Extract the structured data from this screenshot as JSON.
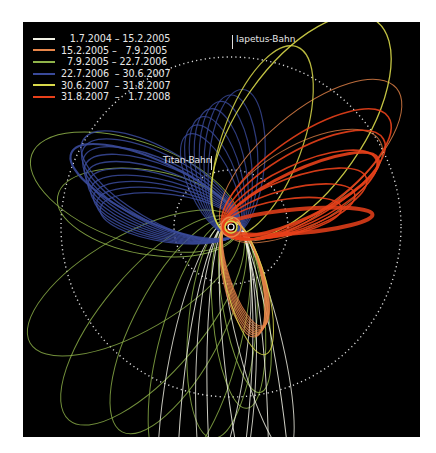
{
  "chart_data": {
    "type": "diagram",
    "title": "",
    "legend": [
      {
        "label": "   1.7.2004 – 15.2.2005",
        "color": "#f2f2e6"
      },
      {
        "label": "15.2.2005 –   7.9.2005",
        "color": "#e8864a"
      },
      {
        "label": "  7.9.2005 – 22.7.2006",
        "color": "#8fb34a"
      },
      {
        "label": "22.7.2006  – 30.6.2007",
        "color": "#3a4a9a"
      },
      {
        "label": "30.6.2007  – 31.8.2007",
        "color": "#d8d84a"
      },
      {
        "label": "31.8.2007  –   1.7.2008",
        "color": "#e8401a"
      }
    ],
    "annotations": [
      {
        "label": "Iapetus-Bahn",
        "type": "dotted-circle",
        "radius_px": 170
      },
      {
        "label": "Titan-Bahn",
        "type": "dotted-circle",
        "radius_px": 57
      }
    ],
    "center": {
      "label": "Saturn"
    }
  },
  "labels": {
    "iapetus": "Iapetus-Bahn",
    "titan": "Titan-Bahn"
  }
}
